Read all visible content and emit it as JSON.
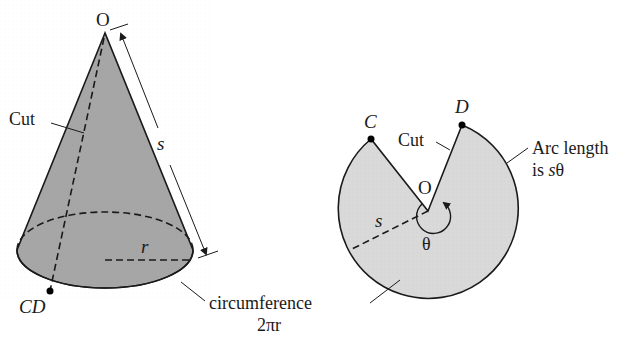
{
  "diagram": {
    "colors": {
      "cone_fill": "#a9a9a9",
      "base_fill": "#b8b8b8",
      "sector_fill": "#d9d9d9",
      "stroke": "#1a1a1a",
      "background": "#ffffff"
    },
    "cone": {
      "apex_label": "O",
      "cut_label": "Cut",
      "slant_label": "s",
      "radius_label": "r",
      "point_label": "CD",
      "circumference_label": "circumference",
      "circumference_formula": "2πr"
    },
    "sector": {
      "center_label": "O",
      "point_c_label": "C",
      "point_d_label": "D",
      "cut_label": "Cut",
      "radius_label": "s",
      "angle_label": "θ",
      "arc_label_line1": "Arc length",
      "arc_label_line2_prefix": "is ",
      "arc_label_line2_var": "s",
      "arc_label_line2_suffix": "θ"
    }
  }
}
